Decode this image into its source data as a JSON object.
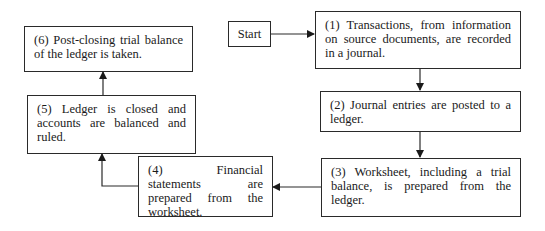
{
  "diagram": {
    "start": {
      "label": "Start"
    },
    "steps": [
      {
        "id": 1,
        "text": "(1) Transactions, from information on source documents, are recorded in a journal."
      },
      {
        "id": 2,
        "text": "(2) Journal entries are posted to a ledger."
      },
      {
        "id": 3,
        "text": "(3) Worksheet, including a trial balance, is prepared from the ledger."
      },
      {
        "id": 4,
        "text": "(4) Financial statements are prepared from the worksheet."
      },
      {
        "id": 5,
        "text": "(5) Ledger is closed and accounts are balanced and ruled."
      },
      {
        "id": 6,
        "text": "(6) Post-closing trial balance of the ledger is taken."
      }
    ],
    "edges": [
      {
        "from": "start",
        "to": 1
      },
      {
        "from": 1,
        "to": 2
      },
      {
        "from": 2,
        "to": 3
      },
      {
        "from": 3,
        "to": 4
      },
      {
        "from": 4,
        "to": 5
      },
      {
        "from": 5,
        "to": 6
      }
    ],
    "colors": {
      "stroke": "#2a2a2a",
      "background": "#ffffff"
    }
  }
}
